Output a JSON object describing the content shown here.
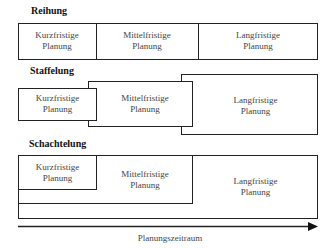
{
  "sections": {
    "reihung": {
      "title": "Reihung"
    },
    "staffelung": {
      "title": "Staffelung"
    },
    "schachtelung": {
      "title": "Schachtelung"
    }
  },
  "labels": {
    "kurz": [
      "Kurzfristige",
      "Planung"
    ],
    "mittel": [
      "Mittelfristige",
      "Planung"
    ],
    "lang": [
      "Langfristige",
      "Planung"
    ]
  },
  "axis": {
    "label": "Planungszeitraum"
  }
}
